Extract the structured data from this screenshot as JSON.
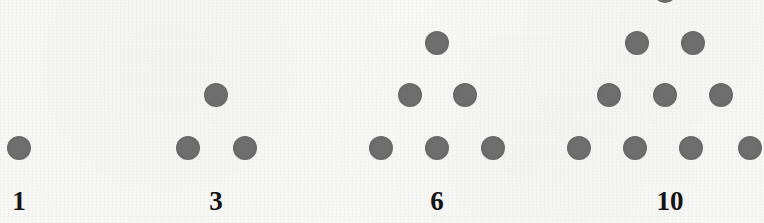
{
  "figure": {
    "name": "triangular-numbers-dot-diagram",
    "background_color": "#f8f8f6",
    "dot_color": "#6e6e6e",
    "label_color": "#141414",
    "dot_diameter": 24,
    "row_spacing": 52,
    "column_spacing": 56,
    "label_baseline_y": 212
  },
  "chart_data": {
    "type": "scatter",
    "title": "",
    "subtitle": "",
    "xlabel": "",
    "ylabel": "",
    "grid": false,
    "legend": "none",
    "categories": [
      "1",
      "3",
      "6",
      "10"
    ],
    "values": [
      1,
      3,
      6,
      10
    ],
    "series": [
      {
        "name": "dot count",
        "values": [
          1,
          3,
          6,
          10
        ]
      },
      {
        "name": "rows",
        "values": [
          1,
          2,
          3,
          4
        ]
      }
    ],
    "annotations": [
      "1",
      "3",
      "6",
      "10"
    ]
  },
  "groups": [
    {
      "id": "group-1",
      "label": "1",
      "label_x": 19,
      "dot_count": 1,
      "rows": 1,
      "dots": [
        {
          "cx": 19,
          "cy": 148
        }
      ]
    },
    {
      "id": "group-3",
      "label": "3",
      "label_x": 216,
      "dot_count": 3,
      "rows": 2,
      "dots": [
        {
          "cx": 216,
          "cy": 95
        },
        {
          "cx": 188,
          "cy": 148
        },
        {
          "cx": 245,
          "cy": 148
        }
      ]
    },
    {
      "id": "group-6",
      "label": "6",
      "label_x": 437,
      "dot_count": 6,
      "rows": 3,
      "dots": [
        {
          "cx": 437,
          "cy": 43
        },
        {
          "cx": 410,
          "cy": 95
        },
        {
          "cx": 465,
          "cy": 95
        },
        {
          "cx": 381,
          "cy": 148
        },
        {
          "cx": 437,
          "cy": 148
        },
        {
          "cx": 493,
          "cy": 148
        }
      ]
    },
    {
      "id": "group-10",
      "label": "10",
      "label_x": 670,
      "dot_count": 10,
      "rows": 4,
      "dots": [
        {
          "cx": 665,
          "cy": -9
        },
        {
          "cx": 637,
          "cy": 43
        },
        {
          "cx": 693,
          "cy": 43
        },
        {
          "cx": 609,
          "cy": 95
        },
        {
          "cx": 665,
          "cy": 95
        },
        {
          "cx": 721,
          "cy": 95
        },
        {
          "cx": 579,
          "cy": 148
        },
        {
          "cx": 635,
          "cy": 148
        },
        {
          "cx": 691,
          "cy": 148
        },
        {
          "cx": 750,
          "cy": 148
        }
      ]
    }
  ]
}
